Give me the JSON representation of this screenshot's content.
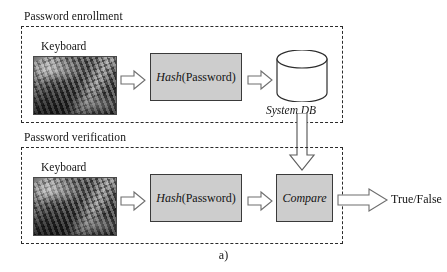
{
  "figure": {
    "caption": "a)"
  },
  "sections": [
    {
      "id": "enrollment",
      "title": "Password enrollment",
      "input_label": "Keyboard",
      "input_icon": "keyboard-photo",
      "process_italic": "Hash",
      "process_regular": " (Password)",
      "store_label": "System DB",
      "store_icon": "database-cylinder"
    },
    {
      "id": "verification",
      "title": "Password verification",
      "input_label": "Keyboard",
      "input_icon": "keyboard-photo",
      "process_italic": "Hash",
      "process_regular": " (Password)",
      "compare_label": "Compare",
      "output_label": "True/False"
    }
  ],
  "arrows": [
    {
      "name": "keyboard-to-hash-enroll",
      "direction": "right"
    },
    {
      "name": "hash-to-db-enroll",
      "direction": "right"
    },
    {
      "name": "db-to-compare",
      "direction": "down"
    },
    {
      "name": "keyboard-to-hash-verify",
      "direction": "right"
    },
    {
      "name": "hash-to-compare-verify",
      "direction": "right"
    },
    {
      "name": "compare-to-output",
      "direction": "right"
    }
  ],
  "colors": {
    "process_fill": "#cdcdcd",
    "stroke": "#3a3a3a",
    "dashed_border": "#2b2b2b",
    "arrow_outline": "#6e6e6e",
    "arrow_fill": "#ffffff",
    "text": "#141414",
    "background": "#ffffff"
  }
}
